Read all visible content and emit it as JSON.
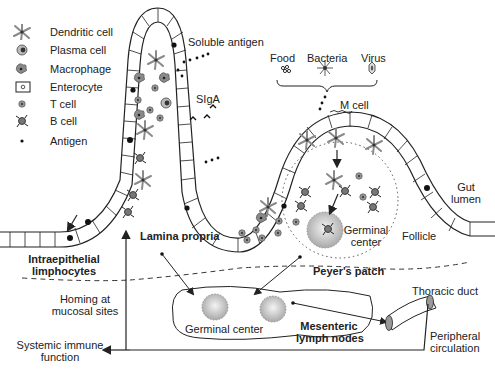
{
  "legend": {
    "items": [
      {
        "icon": "dendritic-cell-icon",
        "label": "Dendritic cell"
      },
      {
        "icon": "plasma-cell-icon",
        "label": "Plasma cell"
      },
      {
        "icon": "macrophage-icon",
        "label": "Macrophage"
      },
      {
        "icon": "enterocyte-icon",
        "label": "Enterocyte"
      },
      {
        "icon": "t-cell-icon",
        "label": "T cell"
      },
      {
        "icon": "b-cell-icon",
        "label": "B cell"
      },
      {
        "icon": "antigen-icon",
        "label": "Antigen"
      }
    ]
  },
  "labels": {
    "soluble_antigen": "Soluble antigen",
    "siga": "SIgA",
    "food": "Food",
    "bacteria": "Bacteria",
    "virus": "Virus",
    "m_cell": "M cell",
    "gut_lumen_1": "Gut",
    "gut_lumen_2": "lumen",
    "germinal_center_pp_1": "Germinal",
    "germinal_center_pp_2": "center",
    "follicle": "Follicle",
    "intraepithelial_1": "Intraepithelial",
    "intraepithelial_2": "limphocytes",
    "lamina_propria": "Lamina propria",
    "peyers_patch": "Peyer's patch",
    "homing_1": "Homing at",
    "homing_2": "mucosal sites",
    "germinal_center_ln": "Germinal center",
    "mesenteric_1": "Mesenteric",
    "mesenteric_2": "lymph nodes",
    "thoracic_duct": "Thoracic duct",
    "peripheral_1": "Peripheral",
    "peripheral_2": "circulation",
    "systemic_1": "Systemic immune",
    "systemic_2": "function"
  },
  "colors": {
    "line": "#222222",
    "cell_gray": "#8a8a8a",
    "germinal_fill": "#bdbdbd",
    "background": "#ffffff"
  }
}
